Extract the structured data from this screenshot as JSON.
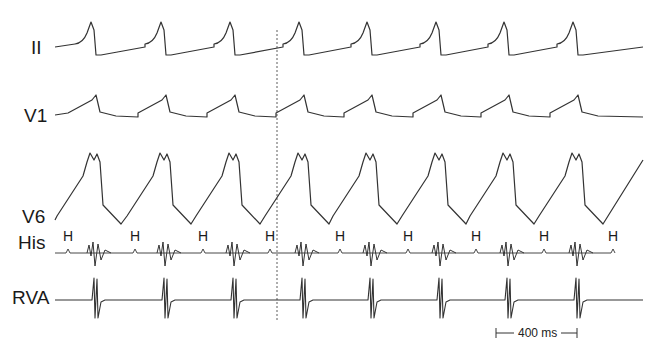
{
  "chart_data": {
    "type": "line",
    "title": "",
    "channels": [
      {
        "name": "II",
        "label_y": 47,
        "baseline_y": 47
      },
      {
        "name": "V1",
        "label_y": 115,
        "baseline_y": 115
      },
      {
        "name": "V6",
        "label_y": 214,
        "baseline_y": 220
      },
      {
        "name": "His",
        "label_y": 244,
        "baseline_y": 253
      },
      {
        "name": "RVA",
        "label_y": 298,
        "baseline_y": 300
      }
    ],
    "beat_x_px": [
      95,
      165,
      234,
      303,
      371,
      440,
      508,
      577
    ],
    "his_marker_label": "H",
    "his_marker_x_px": [
      68,
      135,
      203,
      270,
      340,
      408,
      476,
      544,
      613
    ],
    "reference_line_x_px": 277,
    "scale_bar": {
      "label": "400 ms",
      "x_start_px": 496,
      "x_end_px": 577
    },
    "cycle_length_ms_approx": 340
  },
  "labels": {
    "ii": "II",
    "v1": "V1",
    "v6": "V6",
    "his": "His",
    "rva": "RVA",
    "h": "H",
    "scale": "400 ms"
  },
  "colors": {
    "trace": "#333333",
    "background": "#ffffff"
  }
}
